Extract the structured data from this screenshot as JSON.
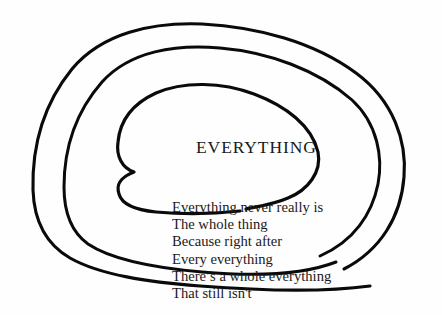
{
  "page": {
    "background_color": "#fefefe",
    "ink_color": "#0a0a0a",
    "width": 442,
    "height": 315
  },
  "artwork": {
    "kind": "hand-drawn-spiral",
    "turns": 3,
    "description": "Three nested hand-drawn spiral arcs opening toward the lower right",
    "strokes": [
      {
        "name": "outer-spiral-arc",
        "stroke_width": 3.1
      },
      {
        "name": "middle-spiral-arc",
        "stroke_width": 3.0
      },
      {
        "name": "inner-spiral-arc",
        "stroke_width": 3.2
      }
    ]
  },
  "title": {
    "text": "EVERYTHING"
  },
  "poem": {
    "lines": [
      "Everything never really is",
      "The whole thing",
      "Because right after",
      "Every everything",
      "There’s a whole everything",
      "That still isn't"
    ]
  }
}
